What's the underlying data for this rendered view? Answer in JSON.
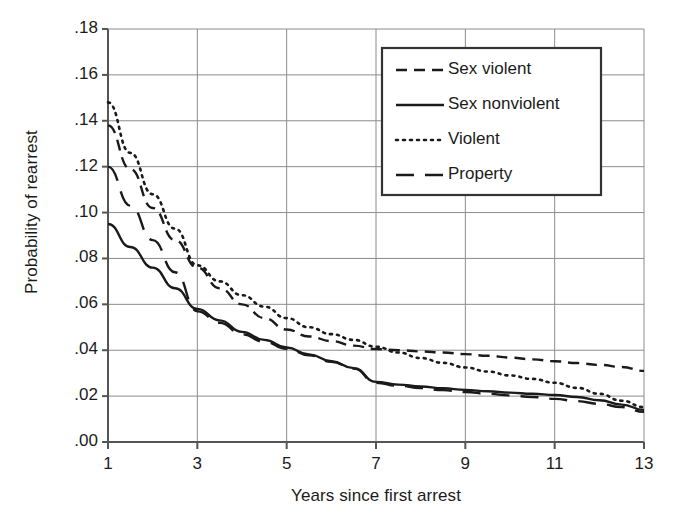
{
  "chart_data": {
    "type": "line",
    "title": "",
    "xlabel": "Years since first arrest",
    "ylabel": "Probability of rearrest",
    "xlim": [
      1,
      13
    ],
    "ylim": [
      0.0,
      0.18
    ],
    "xticks": [
      "1",
      "3",
      "5",
      "7",
      "9",
      "11",
      "13"
    ],
    "xtick_values": [
      1,
      3,
      5,
      7,
      9,
      11,
      13
    ],
    "yticks": [
      ".18",
      ".16",
      ".14",
      ".12",
      ".10",
      ".08",
      ".06",
      ".04",
      ".02",
      ".00"
    ],
    "ytick_values": [
      0.18,
      0.16,
      0.14,
      0.12,
      0.1,
      0.08,
      0.06,
      0.04,
      0.02,
      0.0
    ],
    "grid": "both",
    "legend_position": "upper right",
    "x": [
      1,
      1.5,
      2,
      2.5,
      3,
      3.5,
      4,
      4.5,
      5,
      5.5,
      6,
      6.5,
      7,
      7.5,
      8,
      8.5,
      9,
      9.5,
      10,
      10.5,
      11,
      11.5,
      12,
      12.5,
      13
    ],
    "series": [
      {
        "name": "Sex violent",
        "linestyle": "dashed",
        "color": "#1a1a1a",
        "values": [
          0.138,
          0.119,
          0.102,
          0.088,
          0.076,
          0.067,
          0.06,
          0.054,
          0.049,
          0.046,
          0.044,
          0.042,
          0.0405,
          0.04,
          0.0395,
          0.039,
          0.0383,
          0.0376,
          0.0368,
          0.036,
          0.0352,
          0.0344,
          0.0336,
          0.0327,
          0.031
        ]
      },
      {
        "name": "Sex nonviolent",
        "linestyle": "solid",
        "color": "#1a1a1a",
        "values": [
          0.095,
          0.085,
          0.076,
          0.067,
          0.058,
          0.053,
          0.048,
          0.0445,
          0.0412,
          0.0382,
          0.0352,
          0.0322,
          0.0262,
          0.025,
          0.0242,
          0.0234,
          0.0227,
          0.0221,
          0.0215,
          0.021,
          0.0205,
          0.0196,
          0.0182,
          0.0163,
          0.014
        ]
      },
      {
        "name": "Violent",
        "linestyle": "dotted",
        "color": "#1a1a1a",
        "values": [
          0.148,
          0.126,
          0.108,
          0.093,
          0.077,
          0.07,
          0.064,
          0.059,
          0.054,
          0.05,
          0.047,
          0.0445,
          0.0415,
          0.039,
          0.0366,
          0.0345,
          0.0325,
          0.0307,
          0.029,
          0.0275,
          0.0258,
          0.0236,
          0.021,
          0.018,
          0.0152
        ]
      },
      {
        "name": "Property",
        "linestyle": "longdash",
        "color": "#1a1a1a",
        "values": [
          0.12,
          0.103,
          0.088,
          0.074,
          0.057,
          0.052,
          0.047,
          0.0437,
          0.0406,
          0.0378,
          0.035,
          0.032,
          0.0258,
          0.0245,
          0.0235,
          0.0226,
          0.0218,
          0.021,
          0.0203,
          0.0196,
          0.0188,
          0.0178,
          0.0166,
          0.0152,
          0.0132
        ]
      }
    ]
  },
  "axes": {
    "frame_color": "#555555",
    "grid_color": "#8c8c8c"
  }
}
